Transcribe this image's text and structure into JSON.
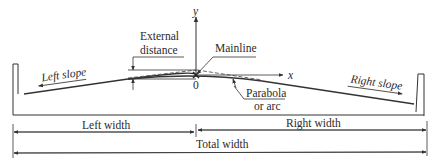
{
  "diagram": {
    "axes": {
      "y_label": "y",
      "x_label": "x",
      "origin_label": "0"
    },
    "labels": {
      "external_distance_line1": "External",
      "external_distance_line2": "distance",
      "mainline": "Mainline",
      "left_slope": "Left slope",
      "right_slope": "Right slope",
      "parabola_line1": "Parabola",
      "parabola_line2": "or arc",
      "left_width": "Left width",
      "right_width": "Right width",
      "total_width": "Total width"
    },
    "colors": {
      "line": "#333333",
      "text": "#2a2a2a",
      "background": "#ffffff"
    }
  }
}
